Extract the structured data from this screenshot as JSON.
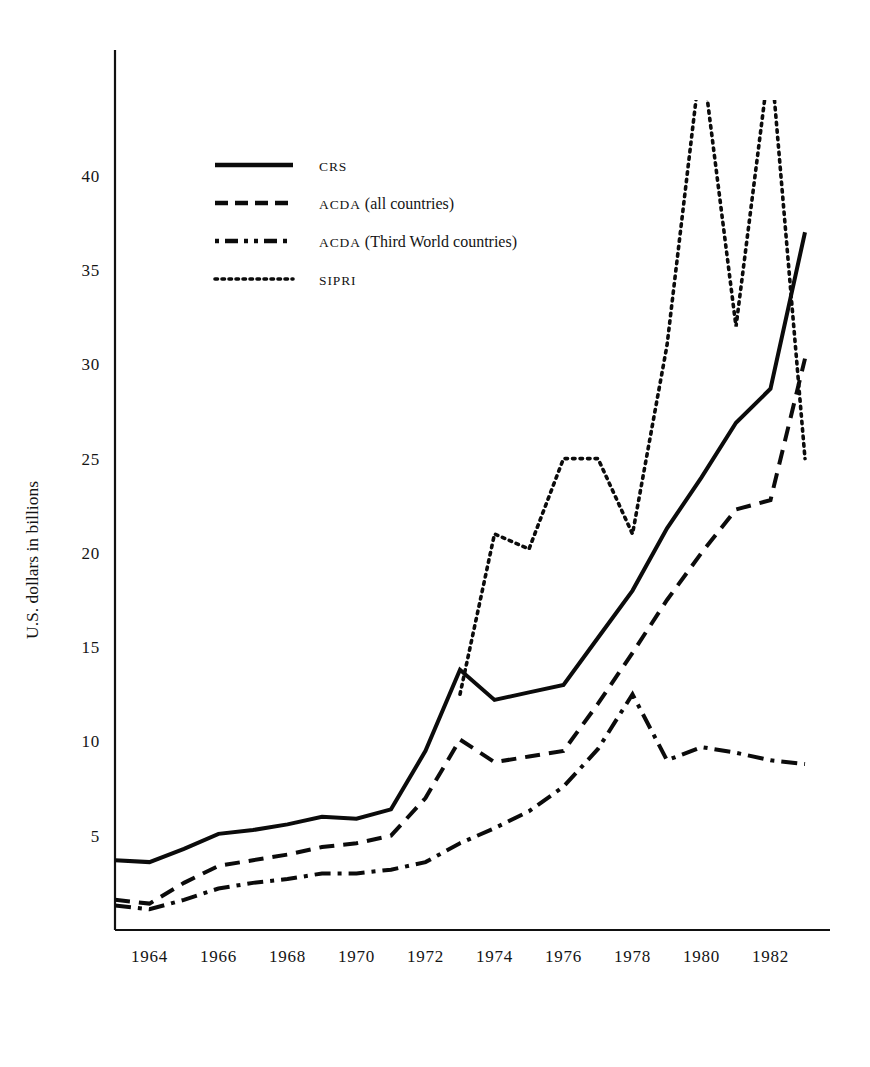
{
  "chart_data": {
    "type": "line",
    "title": "",
    "xlabel": "",
    "ylabel": "U.S. dollars in billions",
    "xlim": [
      1963,
      1983
    ],
    "ylim": [
      0,
      45
    ],
    "grid": false,
    "legend_position": "upper-left-inside",
    "xticks": [
      "1964",
      "1966",
      "1968",
      "1970",
      "1972",
      "1974",
      "1976",
      "1978",
      "1980",
      "1982"
    ],
    "xtick_values": [
      1964,
      1966,
      1968,
      1970,
      1972,
      1974,
      1976,
      1978,
      1980,
      1982
    ],
    "yticks": [
      "5",
      "10",
      "15",
      "20",
      "25",
      "30",
      "35",
      "40"
    ],
    "ytick_values": [
      5,
      10,
      15,
      20,
      25,
      30,
      35,
      40
    ],
    "series": [
      {
        "name": "CRS",
        "style": "solid",
        "x": [
          1963,
          1964,
          1965,
          1966,
          1967,
          1968,
          1969,
          1970,
          1971,
          1972,
          1973,
          1974,
          1975,
          1976,
          1977,
          1978,
          1979,
          1980,
          1981,
          1982,
          1983
        ],
        "values": [
          3.7,
          3.6,
          4.3,
          5.1,
          5.3,
          5.6,
          6.0,
          5.9,
          6.4,
          9.5,
          13.8,
          12.2,
          12.6,
          13.0,
          15.5,
          18.0,
          21.3,
          24.0,
          26.9,
          28.7,
          37.0
        ]
      },
      {
        "name": "ACDA (all countries)",
        "style": "dashed",
        "x": [
          1963,
          1964,
          1965,
          1966,
          1967,
          1968,
          1969,
          1970,
          1971,
          1972,
          1973,
          1974,
          1975,
          1976,
          1977,
          1978,
          1979,
          1980,
          1981,
          1982,
          1983
        ],
        "values": [
          1.6,
          1.4,
          2.5,
          3.4,
          3.7,
          4.0,
          4.4,
          4.6,
          5.0,
          7.0,
          10.1,
          8.9,
          9.2,
          9.5,
          12.0,
          14.7,
          17.5,
          20.0,
          22.3,
          22.8,
          30.3
        ]
      },
      {
        "name": "ACDA (Third World countries)",
        "style": "dash-dot",
        "x": [
          1963,
          1964,
          1965,
          1966,
          1967,
          1968,
          1969,
          1970,
          1971,
          1972,
          1973,
          1974,
          1975,
          1976,
          1977,
          1978,
          1979,
          1980,
          1981,
          1982,
          1983
        ],
        "values": [
          1.3,
          1.1,
          1.6,
          2.2,
          2.5,
          2.7,
          3.0,
          3.0,
          3.2,
          3.6,
          4.6,
          5.4,
          6.3,
          7.6,
          9.6,
          12.5,
          9.0,
          9.7,
          9.4,
          9.0,
          8.8
        ]
      },
      {
        "name": "SIPRI",
        "style": "dotted",
        "x": [
          1973,
          1974,
          1975,
          1976,
          1977,
          1978,
          1979,
          1980,
          1981,
          1982,
          1983
        ],
        "values": [
          12.5,
          21.0,
          20.2,
          25.0,
          25.0,
          21.0,
          31.0,
          46.5,
          32.0,
          46.5,
          25.0
        ]
      }
    ],
    "legend_entries": [
      {
        "label_smallcaps": "CRS",
        "label_rest": "",
        "style": "solid"
      },
      {
        "label_smallcaps": "ACDA",
        "label_rest": " (all countries)",
        "style": "dashed"
      },
      {
        "label_smallcaps": "ACDA",
        "label_rest": " (Third World countries)",
        "style": "dash-dot"
      },
      {
        "label_smallcaps": "SIPRI",
        "label_rest": "",
        "style": "dotted"
      }
    ]
  },
  "axis": {
    "y_title": "U.S. dollars in billions"
  }
}
